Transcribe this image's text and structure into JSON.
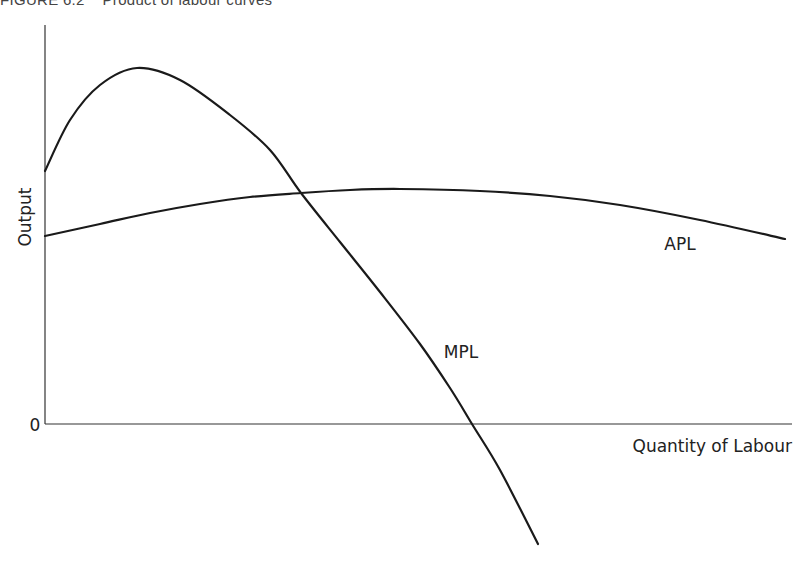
{
  "figure": {
    "title": "FIGURE 6.2    Product of labour curves"
  },
  "chart_data": {
    "type": "line",
    "title": "Product of labour curves",
    "xlabel": "Quantity of Labour",
    "ylabel": "Output",
    "origin_label": "0",
    "grid": false,
    "legend": "inline curve labels",
    "ticks": "none (qualitative axes)",
    "series": [
      {
        "name": "MPL",
        "label_position": [
          460,
          352
        ],
        "points_px": [
          [
            45,
            171
          ],
          [
            70,
            120
          ],
          [
            100,
            85
          ],
          [
            137,
            68
          ],
          [
            180,
            80
          ],
          [
            230,
            115
          ],
          [
            270,
            150
          ],
          [
            301,
            193
          ],
          [
            340,
            242
          ],
          [
            380,
            292
          ],
          [
            420,
            344
          ],
          [
            450,
            388
          ],
          [
            472,
            424
          ],
          [
            500,
            470
          ],
          [
            538,
            544
          ]
        ],
        "description": "Marginal product of labour: rises to a peak, then falls, crossing APL at APL's maximum and dropping below zero"
      },
      {
        "name": "APL",
        "label_position": [
          680,
          244
        ],
        "points_px": [
          [
            45,
            236
          ],
          [
            100,
            224
          ],
          [
            150,
            213
          ],
          [
            200,
            204
          ],
          [
            250,
            197
          ],
          [
            301,
            193
          ],
          [
            350,
            190
          ],
          [
            400,
            189
          ],
          [
            480,
            191
          ],
          [
            550,
            196
          ],
          [
            620,
            205
          ],
          [
            700,
            220
          ],
          [
            785,
            239
          ]
        ],
        "description": "Average product of labour: rises gently to a maximum where MPL intersects it, then declines"
      }
    ],
    "axes": {
      "origin_px": [
        45,
        424
      ],
      "x_end_px": 792,
      "y_top_px": 25
    },
    "colors": {
      "curve": "#1a1a1a",
      "axis": "#333333",
      "text": "#222222"
    }
  }
}
